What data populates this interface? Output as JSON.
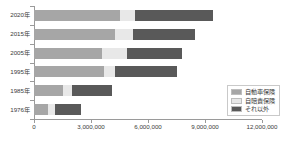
{
  "chart_data": {
    "type": "bar",
    "orientation": "horizontal",
    "stacked": true,
    "title": "",
    "xlabel": "",
    "ylabel": "",
    "categories": [
      "2020年",
      "2015年",
      "2005年",
      "1995年",
      "1985年",
      "1976年"
    ],
    "series": [
      {
        "name": "自動車保険",
        "color": "#a6a6a6",
        "values": [
          4500000,
          4250000,
          3600000,
          3700000,
          1500000,
          750000
        ]
      },
      {
        "name": "自賠責保険",
        "color": "#e8e8e8",
        "values": [
          800000,
          950000,
          1300000,
          550000,
          500000,
          350000
        ]
      },
      {
        "name": "それ以外",
        "color": "#595959",
        "values": [
          4100000,
          3300000,
          2900000,
          3250000,
          2100000,
          1400000
        ]
      }
    ],
    "totals": [
      9400000,
      8500000,
      7800000,
      7500000,
      4100000,
      2500000
    ],
    "xlim": [
      0,
      12000000
    ],
    "xticks": [
      0,
      3000000,
      6000000,
      9000000,
      12000000
    ],
    "xtick_labels": [
      "0",
      "3,000,000",
      "6,000,000",
      "9,000,000",
      "12,000,000"
    ],
    "grid": false,
    "legend_position": "bottom-right"
  },
  "legend": {
    "items": [
      {
        "label": "自動車保険",
        "color": "#a6a6a6"
      },
      {
        "label": "自賠責保険",
        "color": "#e8e8e8"
      },
      {
        "label": "それ以外",
        "color": "#595959"
      }
    ]
  }
}
